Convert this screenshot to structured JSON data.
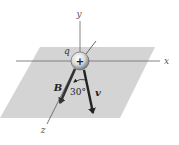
{
  "diagram": {
    "type": "3d-vector-diagram",
    "plane": {
      "color": "#d4d4d4"
    },
    "axes": {
      "x": {
        "label": "x"
      },
      "y": {
        "label": "y"
      },
      "z": {
        "label": "z"
      },
      "color": "#777777"
    },
    "charge": {
      "label": "q",
      "sign": "+"
    },
    "vectors": [
      {
        "id": "B",
        "label": "B",
        "color": "#333333"
      },
      {
        "id": "v",
        "label": "v",
        "color": "#222222"
      }
    ],
    "angle": {
      "label": "30°",
      "between": [
        "B",
        "v"
      ]
    }
  }
}
